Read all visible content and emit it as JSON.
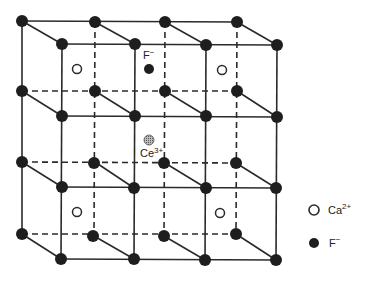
{
  "diagram": {
    "labels": {
      "f_minus_top": "F",
      "f_minus_top_sup": "−",
      "ce_label": "Ce",
      "ce_sup": "3+"
    },
    "legend": {
      "ca": {
        "label": "Ca",
        "sup": "2+"
      },
      "f": {
        "label": "F",
        "sup": "−"
      }
    },
    "colors": {
      "line": "#2a2a2a",
      "node": "#1e1e1e",
      "ce_fill": "#9a9a9a",
      "background": "#ffffff"
    }
  }
}
